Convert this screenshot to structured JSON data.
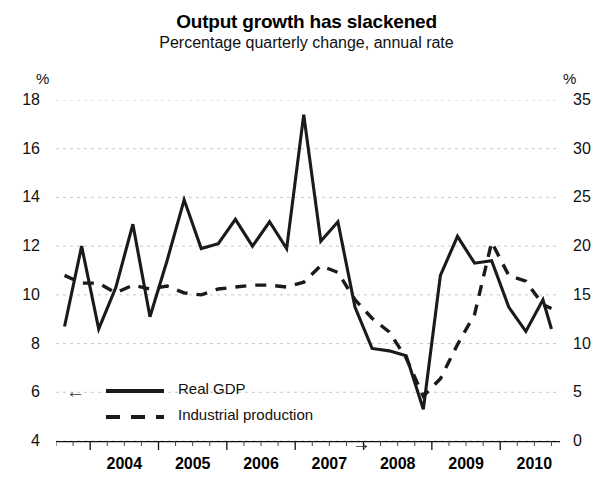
{
  "chart_data": {
    "type": "line",
    "title": "Output growth has slackened",
    "subtitle": "Percentage quarterly change, annual rate",
    "xlabel": "",
    "ylabel": "%",
    "y2label": "%",
    "grid": true,
    "legend_position": "inside-bottom-left",
    "ylim": [
      4,
      18
    ],
    "yticks": [
      4,
      6,
      8,
      10,
      12,
      14,
      16,
      18
    ],
    "y2lim": [
      0,
      35
    ],
    "y2ticks": [
      0,
      5,
      10,
      15,
      20,
      25,
      30,
      35
    ],
    "xlim": [
      2003.5,
      2010.875
    ],
    "xticks": [
      2004,
      2005,
      2006,
      2007,
      2008,
      2009,
      2010
    ],
    "xticklabels": [
      "2004",
      "2005",
      "2006",
      "2007",
      "2008",
      "2009",
      "2010"
    ],
    "minor_xticks_per_year": 4,
    "x": [
      2003.625,
      2003.875,
      2004.125,
      2004.375,
      2004.625,
      2004.875,
      2005.125,
      2005.375,
      2005.625,
      2005.875,
      2006.125,
      2006.375,
      2006.625,
      2006.875,
      2007.125,
      2007.375,
      2007.625,
      2007.875,
      2008.125,
      2008.375,
      2008.625,
      2008.875,
      2009.125,
      2009.375,
      2009.625,
      2009.875,
      2010.125,
      2010.375,
      2010.625,
      2010.75
    ],
    "series": [
      {
        "name": "Real GDP",
        "style": "solid",
        "axis": "left",
        "arrow": "←",
        "color": "#1a1a1a",
        "values": [
          8.7,
          12.0,
          8.6,
          10.3,
          12.9,
          9.1,
          11.4,
          13.9,
          11.9,
          12.1,
          13.1,
          12.0,
          13.0,
          11.9,
          17.4,
          12.2,
          13.0,
          9.5,
          7.8,
          7.7,
          7.5,
          5.3,
          10.8,
          12.4,
          11.3,
          11.4,
          9.5,
          8.5,
          9.8,
          8.6
        ]
      },
      {
        "name": "Industrial production",
        "style": "dashed",
        "axis": "right",
        "arrow": "→",
        "color": "#1a1a1a",
        "values": [
          17.0,
          16.2,
          16.2,
          15.2,
          16.0,
          15.6,
          15.9,
          15.2,
          15.0,
          15.6,
          15.8,
          16.0,
          16.0,
          15.8,
          16.3,
          18.0,
          17.3,
          14.5,
          12.6,
          11.2,
          8.5,
          4.6,
          6.4,
          9.9,
          13.0,
          20.4,
          17.0,
          16.4,
          14.0,
          13.6
        ]
      }
    ],
    "annotations": []
  },
  "axis_units": {
    "left": "%",
    "right": "%"
  },
  "legend": {
    "items": [
      {
        "label": "Real GDP",
        "style": "solid",
        "arrow": "←"
      },
      {
        "label": "Industrial production",
        "style": "dashed",
        "arrow": "→"
      }
    ]
  }
}
